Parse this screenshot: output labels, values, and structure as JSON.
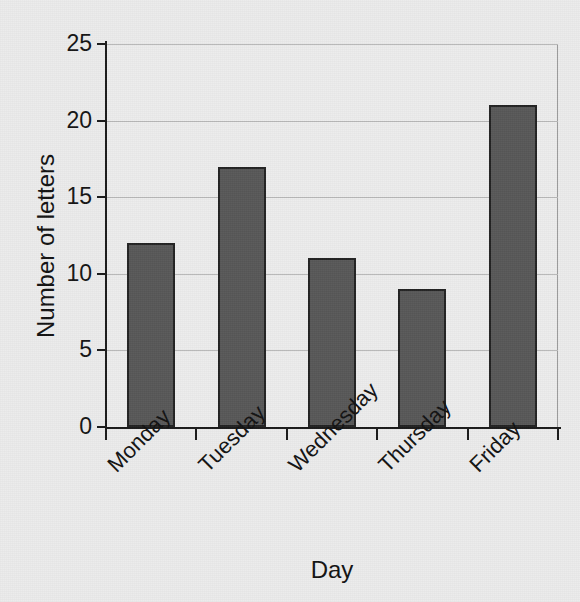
{
  "chart_data": {
    "type": "bar",
    "title": "",
    "title_note": "title row is cropped off the top edge of the image; only letter descenders are visible",
    "categories": [
      "Monday",
      "Tuesday",
      "Wednesday",
      "Thursday",
      "Friday"
    ],
    "values": [
      12,
      17,
      11,
      9,
      21
    ],
    "xlabel": "Day",
    "ylabel": "Number of letters",
    "ylim": [
      0,
      25
    ],
    "ytick_labels": [
      "0",
      "5",
      "10",
      "15",
      "20",
      "25"
    ],
    "ytick_values": [
      0,
      5,
      10,
      15,
      20,
      25
    ],
    "grid": "horizontal",
    "legend": "none",
    "bar_color": "#585858",
    "bar_edge_color": "#232323",
    "background_color": "#ececec",
    "plot_background_color": "#ededed",
    "gridline_color": "#b9b9b9",
    "axis_color": "#1b1b1b",
    "xtick_label_rotation_deg": -45,
    "series": [
      {
        "name": "Number of letters",
        "points": [
          {
            "category": "Monday",
            "value": 12
          },
          {
            "category": "Tuesday",
            "value": 17
          },
          {
            "category": "Wednesday",
            "value": 11
          },
          {
            "category": "Thursday",
            "value": 9
          },
          {
            "category": "Friday",
            "value": 21
          }
        ]
      }
    ]
  }
}
